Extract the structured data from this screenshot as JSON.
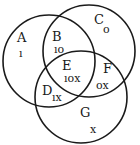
{
  "diagram": {
    "type": "venn",
    "circles": [
      {
        "id": "left",
        "cx": 49,
        "cy": 61,
        "r": 46
      },
      {
        "id": "top-right",
        "cx": 89,
        "cy": 51,
        "r": 46
      },
      {
        "id": "bottom",
        "cx": 81,
        "cy": 97,
        "r": 46
      }
    ],
    "regions": [
      {
        "letter": "A",
        "mark": "ı",
        "lx": 17,
        "ly": 42,
        "mx": 19,
        "my": 57
      },
      {
        "letter": "B",
        "mark": "ıo",
        "lx": 52,
        "ly": 41,
        "mx": 54,
        "my": 53
      },
      {
        "letter": "C",
        "mark": "o",
        "lx": 94,
        "ly": 24,
        "mx": 103,
        "my": 33
      },
      {
        "letter": "E",
        "mark": "ıox",
        "lx": 62,
        "ly": 70,
        "mx": 64,
        "my": 82
      },
      {
        "letter": "F",
        "mark": "ox",
        "lx": 103,
        "ly": 73,
        "mx": 96,
        "my": 89
      },
      {
        "letter": "D",
        "mark": "ıx",
        "lx": 42,
        "ly": 95,
        "mx": 52,
        "my": 101
      },
      {
        "letter": "G",
        "mark": "x",
        "lx": 80,
        "ly": 117,
        "mx": 90,
        "my": 133
      }
    ]
  }
}
